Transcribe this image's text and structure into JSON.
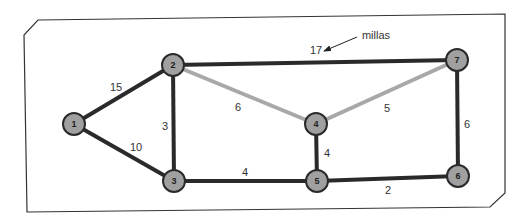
{
  "diagram": {
    "type": "weighted-graph",
    "annotation": {
      "label": "millas",
      "points_to": "17"
    },
    "colors": {
      "node_fill": "#a0a0a0",
      "node_border": "#2a2a2a",
      "edge_dark": "#2a2a2a",
      "edge_light": "#a8a8a8",
      "frame": "#333333"
    },
    "nodes": [
      {
        "id": "1",
        "label": "1"
      },
      {
        "id": "2",
        "label": "2"
      },
      {
        "id": "3",
        "label": "3"
      },
      {
        "id": "4",
        "label": "4"
      },
      {
        "id": "5",
        "label": "5"
      },
      {
        "id": "6",
        "label": "6"
      },
      {
        "id": "7",
        "label": "7"
      }
    ],
    "edges": [
      {
        "from": "1",
        "to": "2",
        "weight": "15",
        "style": "dark"
      },
      {
        "from": "1",
        "to": "3",
        "weight": "10",
        "style": "dark"
      },
      {
        "from": "2",
        "to": "3",
        "weight": "3",
        "style": "dark"
      },
      {
        "from": "2",
        "to": "7",
        "weight": "17",
        "style": "dark"
      },
      {
        "from": "2",
        "to": "4",
        "weight": "6",
        "style": "light"
      },
      {
        "from": "4",
        "to": "7",
        "weight": "5",
        "style": "light"
      },
      {
        "from": "4",
        "to": "5",
        "weight": "4",
        "style": "dark"
      },
      {
        "from": "3",
        "to": "5",
        "weight": "4",
        "style": "dark"
      },
      {
        "from": "5",
        "to": "6",
        "weight": "2",
        "style": "dark"
      },
      {
        "from": "7",
        "to": "6",
        "weight": "6",
        "style": "dark"
      }
    ]
  }
}
